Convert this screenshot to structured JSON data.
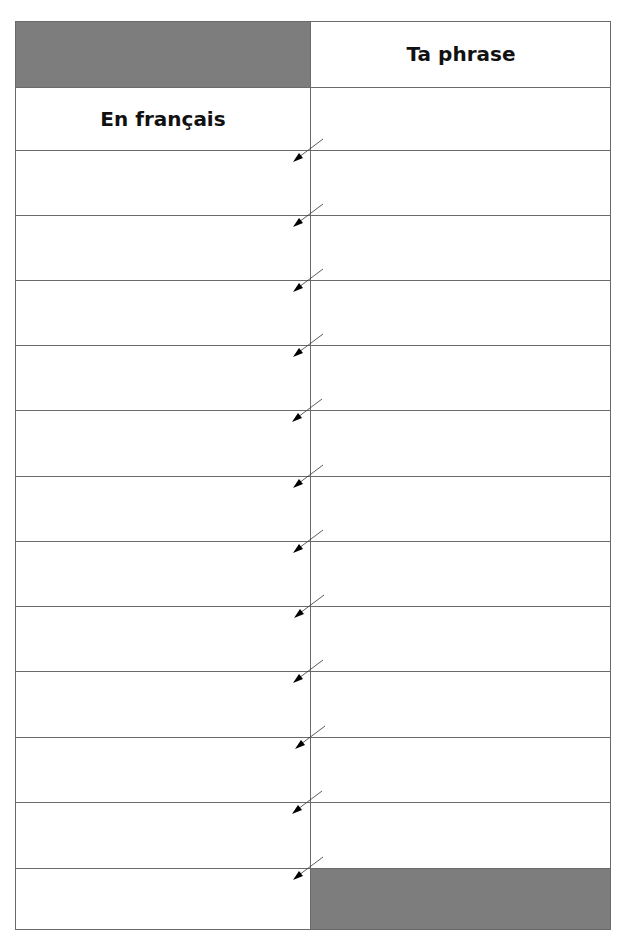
{
  "worksheet": {
    "header_right": "Ta phrase",
    "header_left": "En français",
    "rows": 12,
    "colors": {
      "shade": "#7d7d7d",
      "lines": "#6a6a6a",
      "background": "#ffffff"
    }
  }
}
